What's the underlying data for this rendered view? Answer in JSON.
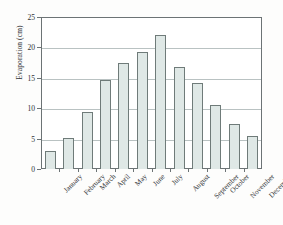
{
  "chart_data": {
    "type": "bar",
    "title": "",
    "xlabel": "",
    "ylabel": "Evaporation (cm)",
    "categories": [
      "January",
      "February",
      "March",
      "April",
      "May",
      "June",
      "July",
      "August",
      "September",
      "October",
      "November",
      "December"
    ],
    "values": [
      3.0,
      5.1,
      9.4,
      14.7,
      17.4,
      19.2,
      22.0,
      16.8,
      14.1,
      10.6,
      7.4,
      5.5
    ],
    "ylim": [
      0,
      25
    ],
    "yticks": [
      0,
      5,
      10,
      15,
      20,
      25
    ],
    "ytick_labels": [
      "0",
      "5",
      "10",
      "15",
      "20",
      "25"
    ],
    "grid": true,
    "grid_axis": "y",
    "legend": false,
    "legend_position": "none",
    "bar_fill_color": "#dfe8e6",
    "bar_edge_color": "#6f7b79",
    "gridline_color": "#b9c2c2",
    "frame_color": "#6c7375",
    "background_color": "#ffffff",
    "xtick_label_rotation": -45
  }
}
